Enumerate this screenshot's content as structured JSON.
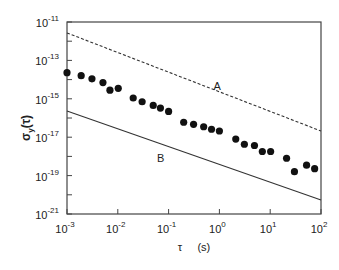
{
  "chart_data": {
    "type": "scatter",
    "title": "",
    "xlabel": "τ     (s)",
    "ylabel": "σy(τ)",
    "xscale": "log",
    "yscale": "log",
    "xlim": [
      0.001,
      100
    ],
    "ylim": [
      1e-21,
      1e-11
    ],
    "grid": false,
    "legend": null,
    "x_ticks": [
      {
        "base": "10",
        "exp": "-3",
        "value": 0.001
      },
      {
        "base": "10",
        "exp": "-2",
        "value": 0.01
      },
      {
        "base": "10",
        "exp": "-1",
        "value": 0.1
      },
      {
        "base": "10",
        "exp": "0",
        "value": 1
      },
      {
        "base": "10",
        "exp": "1",
        "value": 10
      },
      {
        "base": "10",
        "exp": "2",
        "value": 100
      }
    ],
    "y_ticks": [
      {
        "base": "10",
        "exp": "-11",
        "value": 1e-11
      },
      {
        "base": "10",
        "exp": "-13",
        "value": 1e-13
      },
      {
        "base": "10",
        "exp": "-15",
        "value": 1e-15
      },
      {
        "base": "10",
        "exp": "-17",
        "value": 1e-17
      },
      {
        "base": "10",
        "exp": "-19",
        "value": 1e-19
      },
      {
        "base": "10",
        "exp": "-21",
        "value": 1e-21
      }
    ],
    "series": [
      {
        "name": "measured",
        "type": "scatter",
        "marker": "filled-circle",
        "x": [
          0.001,
          0.0019,
          0.0031,
          0.0051,
          0.007,
          0.0102,
          0.0201,
          0.0301,
          0.0498,
          0.069,
          0.1,
          0.198,
          0.31,
          0.49,
          0.7,
          1.0,
          2.1,
          3.1,
          4.9,
          7.0,
          10.2,
          21,
          30,
          52,
          75
        ],
        "y": [
          2.3e-14,
          1.6e-14,
          1.1e-14,
          7e-15,
          2.8e-15,
          3.5e-15,
          1.1e-15,
          7e-16,
          4.5e-16,
          3.3e-16,
          2.2e-16,
          6e-17,
          4.7e-17,
          3.5e-17,
          2.6e-17,
          2.1e-17,
          8e-18,
          4.3e-18,
          3.7e-18,
          1.8e-18,
          1.8e-18,
          8e-19,
          1.6e-19,
          3.5e-19,
          2.3e-19
        ]
      },
      {
        "name": "A",
        "type": "line",
        "style": "dashed",
        "x": [
          0.001,
          100
        ],
        "y": [
          2.7e-12,
          2.1e-17
        ]
      },
      {
        "name": "B",
        "type": "line",
        "style": "solid",
        "x": [
          0.001,
          100
        ],
        "y": [
          2.3e-16,
          5.4e-21
        ]
      }
    ],
    "annotations": [
      {
        "text": "A",
        "x": 0.9,
        "y": 3e-15
      },
      {
        "text": "B",
        "x": 0.07,
        "y": 5e-19
      }
    ]
  }
}
